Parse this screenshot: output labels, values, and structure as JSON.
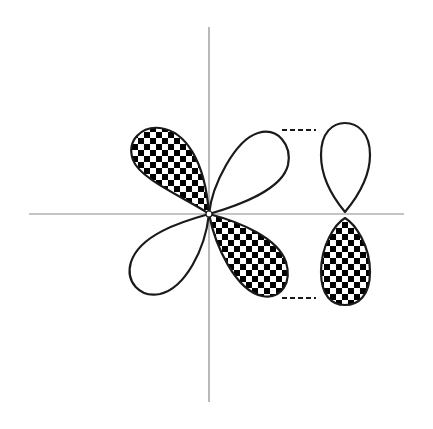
{
  "diagram": {
    "colors": {
      "background": "#ffffff",
      "axis": "#8a8a8a",
      "outline": "#1a1a1a",
      "checker_dark": "#000000",
      "checker_light": "#ffffff"
    },
    "axes": {
      "vertical": {
        "x": 209,
        "y1": 27,
        "y2": 402
      },
      "horizontal": {
        "y": 214,
        "x1": 29,
        "x2": 404
      }
    },
    "lobes": [
      {
        "name": "d-lobe-upper-left",
        "phase": "shaded"
      },
      {
        "name": "d-lobe-upper-right",
        "phase": "unshaded"
      },
      {
        "name": "d-lobe-lower-left",
        "phase": "unshaded"
      },
      {
        "name": "d-lobe-lower-right",
        "phase": "shaded"
      },
      {
        "name": "p-lobe-top",
        "phase": "unshaded"
      },
      {
        "name": "p-lobe-bottom",
        "phase": "shaded"
      }
    ],
    "dashed_lines": [
      {
        "name": "upper-dash",
        "y": 130,
        "x1": 282,
        "x2": 316
      },
      {
        "name": "lower-dash",
        "y": 298,
        "x1": 282,
        "x2": 316
      }
    ]
  }
}
